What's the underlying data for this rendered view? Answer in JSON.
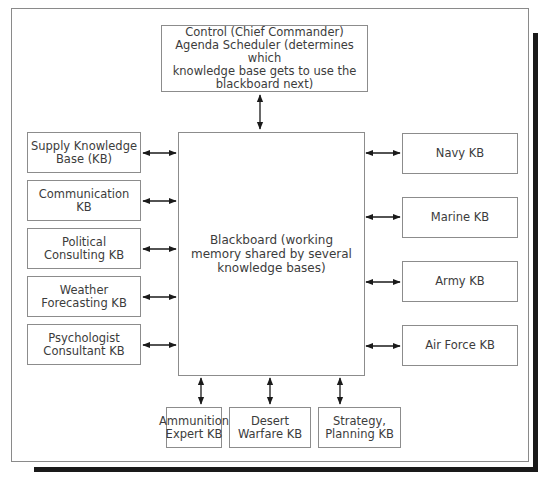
{
  "diagram": {
    "control": "Control (Chief Commander)\nAgenda Scheduler (determines which\nknowledge base gets to use the\nblackboard next)",
    "blackboard": "Blackboard (working\nmemory shared by several\nknowledge bases)",
    "left_kbs": [
      {
        "label": "Supply Knowledge\nBase (KB)"
      },
      {
        "label": "Communication\nKB"
      },
      {
        "label": "Political\nConsulting KB"
      },
      {
        "label": "Weather\nForecasting KB"
      },
      {
        "label": "Psychologist\nConsultant KB"
      }
    ],
    "right_kbs": [
      {
        "label": "Navy KB"
      },
      {
        "label": "Marine KB"
      },
      {
        "label": "Army KB"
      },
      {
        "label": "Air Force KB"
      }
    ],
    "bottom_kbs": [
      {
        "label": "Ammunition\nExpert KB"
      },
      {
        "label": "Desert\nWarfare KB"
      },
      {
        "label": "Strategy,\nPlanning KB"
      }
    ],
    "connector": "bidirectional-arrow"
  }
}
